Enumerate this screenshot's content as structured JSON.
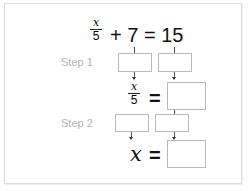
{
  "equation": {
    "fraction_numerator": "x",
    "fraction_denominator": "5",
    "rest": "+ 7 = 15"
  },
  "steps": [
    {
      "label": "Step 1"
    },
    {
      "label": "Step 2"
    }
  ],
  "intermediate": {
    "fraction_numerator": "x",
    "fraction_denominator": "5",
    "equals": "="
  },
  "final": {
    "variable": "x",
    "equals": "="
  },
  "colors": {
    "step_label": "#b4b4b4",
    "box_border": "#b8b8b8",
    "frame_border": "#dcdcdc"
  }
}
